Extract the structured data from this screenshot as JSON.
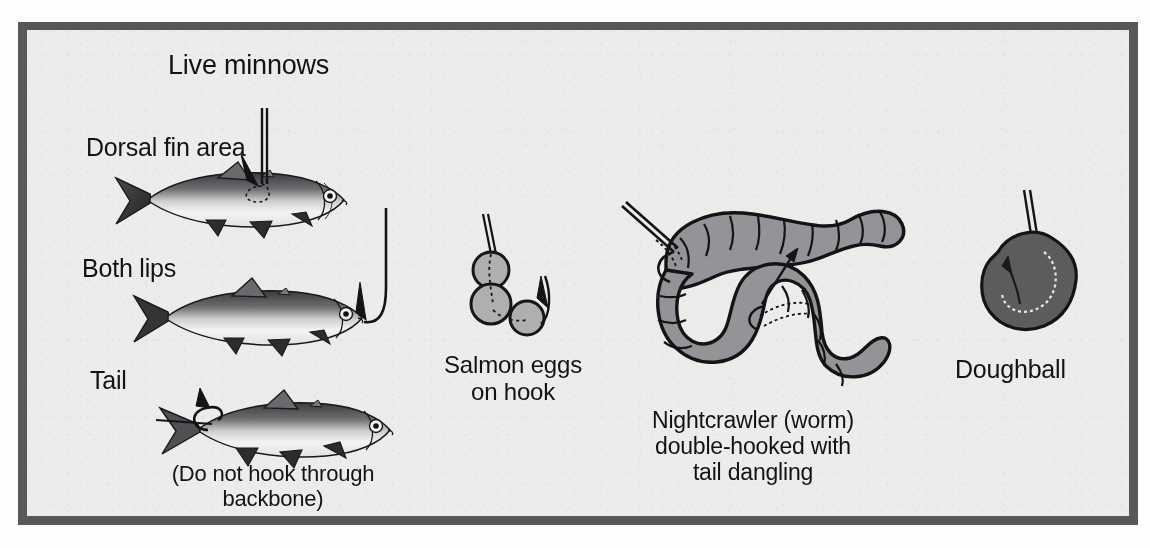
{
  "figure": {
    "title": "Live minnows",
    "frame_color": "#58585a",
    "panel_color": "#edecea",
    "ink_color": "#131313",
    "bait_gray": "#8f9093",
    "dough_gray": "#5c5c5e"
  },
  "minnows": {
    "labels": [
      {
        "id": "dorsal",
        "text": "Dorsal fin area"
      },
      {
        "id": "lips",
        "text": "Both lips"
      },
      {
        "id": "tail",
        "text": "Tail"
      }
    ],
    "caption": "(Do not hook through\nbackbone)"
  },
  "baits": [
    {
      "id": "salmon-eggs",
      "caption": "Salmon eggs\non hook",
      "egg_count": 3
    },
    {
      "id": "nightcrawler",
      "caption": "Nightcrawler (worm)\ndouble-hooked with\ntail dangling",
      "hook_count": 2
    },
    {
      "id": "doughball",
      "caption": "Doughball",
      "hook_count": 1
    }
  ]
}
